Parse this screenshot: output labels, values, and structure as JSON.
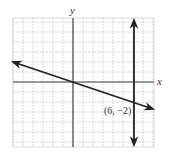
{
  "chart_data": {
    "type": "line",
    "title": "",
    "xlabel": "x",
    "ylabel": "y",
    "xlim": [
      -6,
      8
    ],
    "ylim": [
      -6.5,
      6.4
    ],
    "grid": true,
    "series": [
      {
        "name": "line through origin",
        "equation": "y = -x/3",
        "points": [
          [
            -6,
            2
          ],
          [
            0,
            0
          ],
          [
            6,
            -2
          ],
          [
            8,
            -2.667
          ]
        ],
        "arrows": "both"
      },
      {
        "name": "vertical line",
        "equation": "x = 6",
        "points": [
          [
            6,
            6.2
          ],
          [
            6,
            -6.3
          ]
        ],
        "arrows": "both"
      }
    ],
    "annotations": [
      {
        "text": "(6, −2)",
        "x": 6,
        "y": -2
      }
    ]
  },
  "labels": {
    "x_axis": "x",
    "y_axis": "y",
    "point": "(6, −2)"
  },
  "colors": {
    "grid": "#c8c8c8",
    "axis": "#333333",
    "line": "#222222"
  }
}
